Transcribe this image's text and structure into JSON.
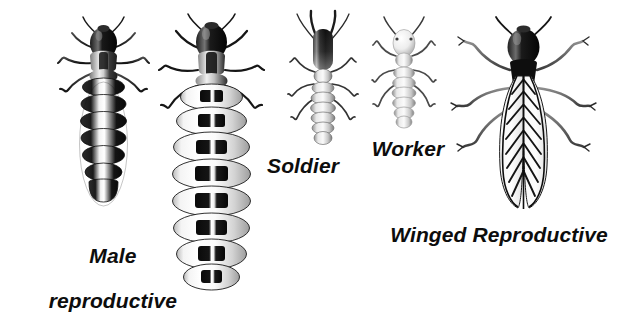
{
  "figure": {
    "background_color": "#ffffff",
    "ink_color": "#111111",
    "style": "grayscale airbrush scientific illustration",
    "width": 642,
    "height": 285
  },
  "labels": [
    {
      "id": "male-reproductive",
      "line1": "Male",
      "line2": "reproductive",
      "x": 100,
      "y": 224,
      "font_size": 21,
      "align": "center"
    },
    {
      "id": "soldier",
      "text": "Soldier",
      "x": 303,
      "y": 156,
      "font_size": 21,
      "align": "center"
    },
    {
      "id": "worker",
      "text": "Worker",
      "x": 408,
      "y": 139,
      "font_size": 21,
      "align": "center"
    },
    {
      "id": "winged-reproductive",
      "text": "Winged Reproductive",
      "x": 499,
      "y": 225,
      "font_size": 21,
      "align": "center"
    }
  ],
  "specimens": [
    {
      "id": "male-reproductive",
      "name": "Male reproductive",
      "caste": "male reproductive (king)",
      "head_color": "#141414",
      "abdomen_pattern": "banded dark and light segments",
      "segments": 7,
      "center_x": 103,
      "top_y": 24,
      "bottom_y": 200,
      "body_width": 46,
      "has_wings": false
    },
    {
      "id": "queen",
      "name": "Queen (physogastric female reproductive)",
      "caste": "female reproductive queen",
      "head_color": "#141414",
      "abdomen_pattern": "hugely swollen pale white segments with dark bands",
      "segments": 8,
      "center_x": 210,
      "top_y": 22,
      "bottom_y": 285,
      "body_width": 78,
      "has_wings": false
    },
    {
      "id": "soldier",
      "name": "Soldier",
      "caste": "soldier",
      "head_color": "#2a2a2a",
      "abdomen_pattern": "pale segmented abdomen",
      "segments": 7,
      "center_x": 322,
      "top_y": 14,
      "bottom_y": 148,
      "body_width": 30,
      "has_wings": false,
      "has_mandibles": true
    },
    {
      "id": "worker",
      "name": "Worker",
      "caste": "worker",
      "head_color": "#d8d8d8",
      "abdomen_pattern": "pale segmented abdomen",
      "segments": 7,
      "center_x": 404,
      "top_y": 18,
      "bottom_y": 132,
      "body_width": 27,
      "has_wings": false
    },
    {
      "id": "winged-reproductive",
      "name": "Winged Reproductive",
      "caste": "alate / winged reproductive",
      "head_color": "#141414",
      "abdomen_pattern": "covered by long veined wings",
      "wing_pattern": "chevron herringbone venation",
      "center_x": 524,
      "top_y": 20,
      "bottom_y": 212,
      "body_width": 40,
      "has_wings": true
    }
  ]
}
